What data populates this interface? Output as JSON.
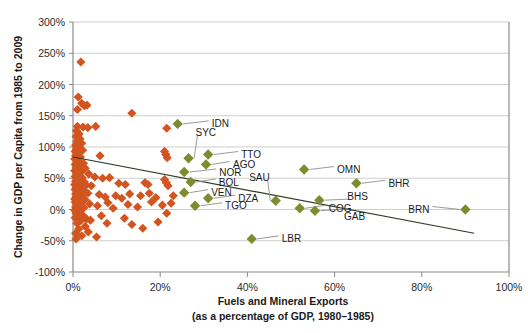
{
  "chart_data": {
    "type": "scatter",
    "title": "",
    "xlabel": "Fuels and Mineral Exports",
    "xlabel_line2": "(as a percentage of GDP, 1980–1985)",
    "ylabel": "Change in GDP per Capita from 1985 to 2009",
    "xlim": [
      0,
      100
    ],
    "ylim": [
      -100,
      300
    ],
    "xticks": [
      "0%",
      "20%",
      "40%",
      "60%",
      "80%",
      "100%"
    ],
    "xtick_values": [
      0,
      20,
      40,
      60,
      80,
      100
    ],
    "yticks": [
      "-100%",
      "-50%",
      "0%",
      "50%",
      "100%",
      "150%",
      "200%",
      "250%",
      "300%"
    ],
    "ytick_values": [
      -100,
      -50,
      0,
      50,
      100,
      150,
      200,
      250,
      300
    ],
    "grid": "horizontal",
    "legend": "none",
    "colors": {
      "other_countries": "#d2551f",
      "labeled_countries": "#7d8c2e",
      "trendline": "#2f3a23",
      "gridline": "#b9b9b9",
      "axis": "#8a8a8a",
      "text": "#1a1a1a"
    },
    "trendline": {
      "x0": 0,
      "y0": 84,
      "x1": 92,
      "y1": -38
    },
    "series": [
      {
        "name": "Labeled resource-rich countries",
        "color": "#7d8c2e",
        "points": [
          {
            "label": "IDN",
            "x": 24.0,
            "y": 137,
            "label_dx": 34,
            "label_dy": 0
          },
          {
            "label": "SYC",
            "x": 26.5,
            "y": 82,
            "label_dx": 7,
            "label_dy": -26
          },
          {
            "label": "TTO",
            "x": 31.0,
            "y": 88,
            "label_dx": 33,
            "label_dy": 0
          },
          {
            "label": "AGO",
            "x": 30.5,
            "y": 72,
            "label_dx": 27,
            "label_dy": 0
          },
          {
            "label": "NOR",
            "x": 25.5,
            "y": 60,
            "label_dx": 35,
            "label_dy": 0
          },
          {
            "label": "BOL",
            "x": 27.0,
            "y": 44,
            "label_dx": 28,
            "label_dy": 0
          },
          {
            "label": "VEN",
            "x": 25.5,
            "y": 27,
            "label_dx": 27,
            "label_dy": 0
          },
          {
            "label": "DZA",
            "x": 31.0,
            "y": 18,
            "label_dx": 30,
            "label_dy": 0
          },
          {
            "label": "TGO",
            "x": 28.0,
            "y": 6,
            "label_dx": 30,
            "label_dy": 0
          },
          {
            "label": "LBR",
            "x": 41.0,
            "y": -47,
            "label_dx": 30,
            "label_dy": 0
          },
          {
            "label": "OMN",
            "x": 53.0,
            "y": 64,
            "label_dx": 33,
            "label_dy": 0
          },
          {
            "label": "BHR",
            "x": 65.0,
            "y": 42,
            "label_dx": 32,
            "label_dy": 0
          },
          {
            "label": "SAU",
            "x": 46.5,
            "y": 14,
            "label_dx": -6,
            "label_dy": -23
          },
          {
            "label": "BHS",
            "x": 56.5,
            "y": 15,
            "label_dx": 28,
            "label_dy": -4
          },
          {
            "label": "COG",
            "x": 52.0,
            "y": 2,
            "label_dx": 29,
            "label_dy": 0
          },
          {
            "label": "GAB",
            "x": 55.5,
            "y": -2,
            "label_dx": 29,
            "label_dy": 6
          },
          {
            "label": "BRN",
            "x": 90.0,
            "y": 0,
            "label_dx": -36,
            "label_dy": 0
          }
        ]
      },
      {
        "name": "Other countries",
        "color": "#d2551f",
        "points": [
          {
            "x": 1.8,
            "y": 236
          },
          {
            "x": 1.2,
            "y": 180
          },
          {
            "x": 2.0,
            "y": 170
          },
          {
            "x": 2.6,
            "y": 166
          },
          {
            "x": 3.2,
            "y": 167
          },
          {
            "x": 1.0,
            "y": 160
          },
          {
            "x": 13.5,
            "y": 154
          },
          {
            "x": 21.5,
            "y": 130
          },
          {
            "x": 1.0,
            "y": 133
          },
          {
            "x": 2.3,
            "y": 132
          },
          {
            "x": 3.4,
            "y": 131
          },
          {
            "x": 5.2,
            "y": 133
          },
          {
            "x": 0.8,
            "y": 126
          },
          {
            "x": 1.4,
            "y": 121
          },
          {
            "x": 0.7,
            "y": 117
          },
          {
            "x": 1.6,
            "y": 113
          },
          {
            "x": 0.9,
            "y": 109
          },
          {
            "x": 2.0,
            "y": 106
          },
          {
            "x": 0.6,
            "y": 103
          },
          {
            "x": 1.3,
            "y": 100
          },
          {
            "x": 0.8,
            "y": 97
          },
          {
            "x": 2.2,
            "y": 95
          },
          {
            "x": 0.5,
            "y": 93
          },
          {
            "x": 1.1,
            "y": 90
          },
          {
            "x": 21.0,
            "y": 93
          },
          {
            "x": 21.3,
            "y": 88
          },
          {
            "x": 21.6,
            "y": 83
          },
          {
            "x": 6.2,
            "y": 86
          },
          {
            "x": 0.6,
            "y": 86
          },
          {
            "x": 1.7,
            "y": 84
          },
          {
            "x": 0.4,
            "y": 81
          },
          {
            "x": 1.2,
            "y": 78
          },
          {
            "x": 0.9,
            "y": 75
          },
          {
            "x": 2.4,
            "y": 74
          },
          {
            "x": 0.5,
            "y": 72
          },
          {
            "x": 1.5,
            "y": 69
          },
          {
            "x": 0.7,
            "y": 67
          },
          {
            "x": 2.8,
            "y": 66
          },
          {
            "x": 1.0,
            "y": 64
          },
          {
            "x": 0.4,
            "y": 62
          },
          {
            "x": 1.9,
            "y": 60
          },
          {
            "x": 0.8,
            "y": 58
          },
          {
            "x": 3.6,
            "y": 57
          },
          {
            "x": 1.3,
            "y": 55
          },
          {
            "x": 0.5,
            "y": 53
          },
          {
            "x": 2.1,
            "y": 51
          },
          {
            "x": 0.9,
            "y": 49
          },
          {
            "x": 5.0,
            "y": 52
          },
          {
            "x": 6.8,
            "y": 50
          },
          {
            "x": 8.4,
            "y": 51
          },
          {
            "x": 1.6,
            "y": 47
          },
          {
            "x": 0.6,
            "y": 45
          },
          {
            "x": 2.6,
            "y": 44
          },
          {
            "x": 1.1,
            "y": 42
          },
          {
            "x": 0.4,
            "y": 40
          },
          {
            "x": 3.0,
            "y": 39
          },
          {
            "x": 1.8,
            "y": 37
          },
          {
            "x": 0.7,
            "y": 36
          },
          {
            "x": 4.2,
            "y": 38
          },
          {
            "x": 10.5,
            "y": 42
          },
          {
            "x": 12.0,
            "y": 40
          },
          {
            "x": 16.5,
            "y": 43
          },
          {
            "x": 17.2,
            "y": 40
          },
          {
            "x": 21.0,
            "y": 48
          },
          {
            "x": 21.4,
            "y": 43
          },
          {
            "x": 21.8,
            "y": 38
          },
          {
            "x": 1.2,
            "y": 34
          },
          {
            "x": 0.5,
            "y": 32
          },
          {
            "x": 2.3,
            "y": 31
          },
          {
            "x": 0.9,
            "y": 29
          },
          {
            "x": 1.5,
            "y": 27
          },
          {
            "x": 0.6,
            "y": 25
          },
          {
            "x": 3.4,
            "y": 26
          },
          {
            "x": 2.0,
            "y": 23
          },
          {
            "x": 0.8,
            "y": 21
          },
          {
            "x": 1.3,
            "y": 19
          },
          {
            "x": 0.4,
            "y": 17
          },
          {
            "x": 2.7,
            "y": 16
          },
          {
            "x": 6.0,
            "y": 24
          },
          {
            "x": 7.4,
            "y": 20
          },
          {
            "x": 9.8,
            "y": 22
          },
          {
            "x": 11.2,
            "y": 18
          },
          {
            "x": 13.0,
            "y": 25
          },
          {
            "x": 15.5,
            "y": 22
          },
          {
            "x": 17.5,
            "y": 26
          },
          {
            "x": 19.0,
            "y": 19
          },
          {
            "x": 23.0,
            "y": 22
          },
          {
            "x": 1.0,
            "y": 14
          },
          {
            "x": 0.5,
            "y": 12
          },
          {
            "x": 1.9,
            "y": 10
          },
          {
            "x": 0.8,
            "y": 8
          },
          {
            "x": 1.4,
            "y": 6
          },
          {
            "x": 0.6,
            "y": 4
          },
          {
            "x": 2.5,
            "y": 3
          },
          {
            "x": 1.1,
            "y": 1
          },
          {
            "x": 0.4,
            "y": -1
          },
          {
            "x": 3.8,
            "y": 9
          },
          {
            "x": 5.6,
            "y": 6
          },
          {
            "x": 8.0,
            "y": 11
          },
          {
            "x": 9.2,
            "y": 2
          },
          {
            "x": 12.6,
            "y": 8
          },
          {
            "x": 14.8,
            "y": 4
          },
          {
            "x": 18.0,
            "y": 12
          },
          {
            "x": 20.5,
            "y": 7
          },
          {
            "x": 22.5,
            "y": 10
          },
          {
            "x": 1.6,
            "y": -4
          },
          {
            "x": 0.7,
            "y": -6
          },
          {
            "x": 2.2,
            "y": -9
          },
          {
            "x": 1.0,
            "y": -11
          },
          {
            "x": 0.5,
            "y": -13
          },
          {
            "x": 3.1,
            "y": -15
          },
          {
            "x": 1.8,
            "y": -18
          },
          {
            "x": 6.5,
            "y": -10
          },
          {
            "x": 4.0,
            "y": -17
          },
          {
            "x": 7.8,
            "y": -22
          },
          {
            "x": 11.8,
            "y": -14
          },
          {
            "x": 13.5,
            "y": -24
          },
          {
            "x": 19.5,
            "y": -20
          },
          {
            "x": 21.5,
            "y": -6
          },
          {
            "x": 16.0,
            "y": -30
          },
          {
            "x": 0.9,
            "y": -22
          },
          {
            "x": 2.8,
            "y": -27
          },
          {
            "x": 1.3,
            "y": -31
          },
          {
            "x": 0.6,
            "y": -38
          },
          {
            "x": 2.0,
            "y": -42
          },
          {
            "x": 5.4,
            "y": -44
          },
          {
            "x": 0.7,
            "y": -47
          },
          {
            "x": 3.5,
            "y": -36
          }
        ]
      }
    ]
  }
}
